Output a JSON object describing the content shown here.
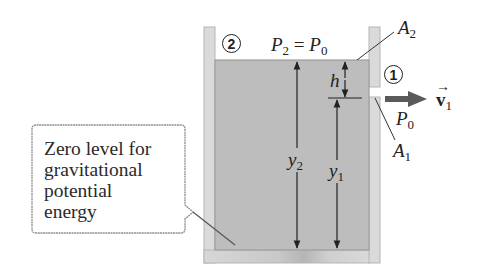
{
  "figure": {
    "type": "diagram",
    "point_labels": {
      "point2": "2",
      "point1": "1"
    },
    "pressure_top": {
      "lhs": "P",
      "lhs_sub": "2",
      "eq": " = ",
      "rhs": "P",
      "rhs_sub": "0"
    },
    "pressure_hole": {
      "symbol": "P",
      "sub": "0"
    },
    "area_top": {
      "symbol": "A",
      "sub": "2"
    },
    "area_hole": {
      "symbol": "A",
      "sub": "1"
    },
    "velocity": {
      "symbol": "v",
      "sub": "1",
      "arrow": "→"
    },
    "dimensions": {
      "h": "h",
      "y1": {
        "symbol": "y",
        "sub": "1"
      },
      "y2": {
        "symbol": "y",
        "sub": "2"
      }
    },
    "callout": {
      "lines": [
        "Zero level for",
        "gravitational",
        "potential",
        "energy"
      ]
    },
    "colors": {
      "fluid": "#bdbdbd",
      "tank_wall": "#d9d9d9",
      "wall_edge": "#a8a8a8",
      "arrow": "#5a5a5a",
      "ink": "#222222",
      "callout_border": "#8f8f8f"
    }
  }
}
